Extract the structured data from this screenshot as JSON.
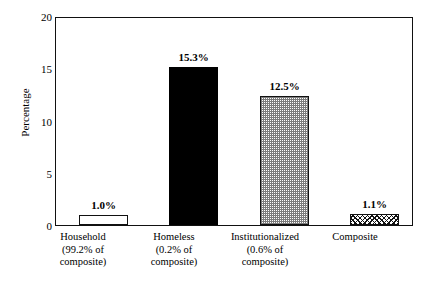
{
  "chart_data": {
    "type": "bar",
    "title": "",
    "xlabel": "",
    "ylabel": "Percentage",
    "ylim": [
      0,
      20
    ],
    "yticks": [
      0,
      5,
      10,
      15,
      20
    ],
    "ytick_labels": [
      "0",
      "5",
      "10",
      "15",
      "20"
    ],
    "grid": false,
    "legend": null,
    "categories": [
      "Household",
      "Homeless",
      "Institutionalized",
      "Composite"
    ],
    "category_sublabels": [
      [
        "(99.2% of",
        "composite)"
      ],
      [
        "(0.2% of",
        "composite)"
      ],
      [
        "(0.6% of",
        "composite)"
      ],
      []
    ],
    "values": [
      1.0,
      15.3,
      12.5,
      1.1
    ],
    "value_labels": [
      "1.0%",
      "15.3%",
      "12.5%",
      "1.1%"
    ],
    "bar_fills": [
      "open",
      "solid",
      "stipple",
      "hatch"
    ],
    "bars": [
      {
        "category": "Household",
        "sub1": "(99.2% of",
        "sub2": "composite)",
        "value": 1.0,
        "value_label": "1.0%",
        "fill": "open"
      },
      {
        "category": "Homeless",
        "sub1": "(0.2% of",
        "sub2": "composite)",
        "value": 15.3,
        "value_label": "15.3%",
        "fill": "solid"
      },
      {
        "category": "Institutionalized",
        "sub1": "(0.6% of",
        "sub2": "composite)",
        "value": 12.5,
        "value_label": "12.5%",
        "fill": "stipple"
      },
      {
        "category": "Composite",
        "sub1": "",
        "sub2": "",
        "value": 1.1,
        "value_label": "1.1%",
        "fill": "hatch"
      }
    ],
    "colors": {
      "axis": "#111111",
      "text": "#000000",
      "background": "#ffffff",
      "solid_bar": "#000000",
      "stipple_bar": "#7c7c7c"
    }
  }
}
